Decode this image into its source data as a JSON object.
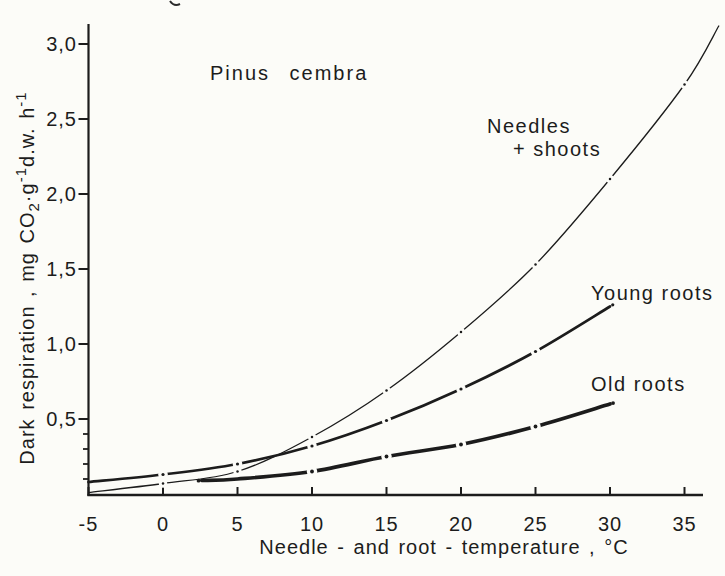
{
  "figure": {
    "species_label": "Pinus cembra",
    "background": "#fcfcf8",
    "ink_color": "#1c1c1c"
  },
  "y_axis": {
    "label_parts": [
      {
        "text": "Dark respiration , mg CO",
        "style": "normal"
      },
      {
        "text": "2",
        "style": "sub"
      },
      {
        "text": "·g",
        "style": "normal"
      },
      {
        "text": "-1",
        "style": "sup"
      },
      {
        "text": "d.w. h",
        "style": "normal"
      },
      {
        "text": "-1",
        "style": "sup"
      }
    ],
    "ticks": [
      {
        "label": "3,0",
        "value": 3.0
      },
      {
        "label": "2,5",
        "value": 2.5
      },
      {
        "label": "2,0",
        "value": 2.0
      },
      {
        "label": "1,5",
        "value": 1.5
      },
      {
        "label": "1,0",
        "value": 1.0
      },
      {
        "label": "0,5",
        "value": 0.5
      }
    ],
    "minor_tick_values": [
      0.1,
      0.2,
      0.3,
      0.4
    ]
  },
  "x_axis": {
    "title": "Needle - and root - temperature , °C",
    "ticks": [
      {
        "label": "-5",
        "value": -5
      },
      {
        "label": "0",
        "value": 0
      },
      {
        "label": "5",
        "value": 5
      },
      {
        "label": "10",
        "value": 10
      },
      {
        "label": "15",
        "value": 15
      },
      {
        "label": "20",
        "value": 20
      },
      {
        "label": "25",
        "value": 25
      },
      {
        "label": "30",
        "value": 30
      },
      {
        "label": "35",
        "value": 35
      }
    ]
  },
  "curve_labels": {
    "needles_line1": "Needles",
    "needles_line2": "+ shoots",
    "young_roots": "Young roots",
    "old_roots": "Old roots"
  },
  "chart_data": {
    "type": "line",
    "title": "Pinus cembra",
    "xlabel": "Needle - and root - temperature, °C",
    "ylabel": "Dark respiration, mg CO2·g-1 d.w. h-1",
    "xlim": [
      -5,
      36.5
    ],
    "ylim": [
      0,
      3.1
    ],
    "grid": false,
    "legend": "direct curve labels on plot",
    "series": [
      {
        "name": "Needles + shoots",
        "line_weight": "thin",
        "points": [
          [
            -5,
            0.01
          ],
          [
            0,
            0.07
          ],
          [
            5,
            0.15
          ],
          [
            10,
            0.38
          ],
          [
            15,
            0.69
          ],
          [
            20,
            1.08
          ],
          [
            25,
            1.53
          ],
          [
            30,
            2.1
          ],
          [
            35,
            2.73
          ]
        ],
        "extend_to": [
          37.3,
          3.12
        ],
        "markers": [
          0,
          5,
          10,
          15,
          20,
          25,
          30,
          35
        ],
        "start_dot": false,
        "end_dot": false
      },
      {
        "name": "Young roots",
        "line_weight": "medium",
        "points": [
          [
            -5,
            0.08
          ],
          [
            0,
            0.13
          ],
          [
            5,
            0.2
          ],
          [
            10,
            0.32
          ],
          [
            15,
            0.49
          ],
          [
            20,
            0.7
          ],
          [
            25,
            0.95
          ],
          [
            30,
            1.25
          ]
        ],
        "markers": [
          0,
          5,
          10,
          15,
          20,
          25
        ],
        "start_dot": false,
        "end_dot": true
      },
      {
        "name": "Old roots",
        "line_weight": "thick",
        "points": [
          [
            2.6,
            0.09
          ],
          [
            5,
            0.1
          ],
          [
            10,
            0.15
          ],
          [
            15,
            0.25
          ],
          [
            20,
            0.33
          ],
          [
            25,
            0.45
          ],
          [
            30,
            0.6
          ]
        ],
        "markers": [
          10,
          15,
          20,
          25
        ],
        "start_dot": true,
        "end_dot": true
      }
    ]
  }
}
